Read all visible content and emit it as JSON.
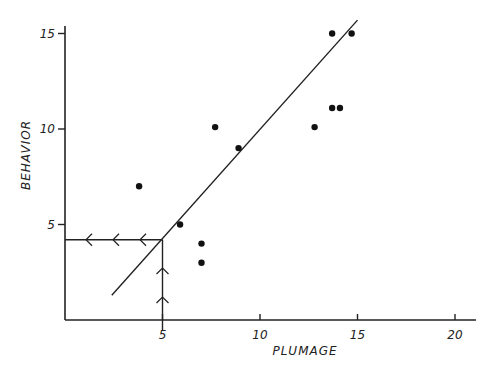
{
  "chart_data": {
    "type": "scatter",
    "title": "",
    "xlabel": "PLUMAGE",
    "ylabel": "BEHAVIOR",
    "xlim": [
      0,
      21
    ],
    "ylim": [
      0,
      16
    ],
    "grid": false,
    "xticks": [
      5,
      10,
      15,
      20
    ],
    "yticks": [
      5,
      10,
      15
    ],
    "xtick_labels": [
      "5",
      "10",
      "15",
      "20"
    ],
    "ytick_labels": [
      "5",
      "10",
      "15"
    ],
    "points": [
      {
        "x": 3.8,
        "y": 7.0
      },
      {
        "x": 5.9,
        "y": 5.0
      },
      {
        "x": 7.0,
        "y": 4.0
      },
      {
        "x": 7.0,
        "y": 3.0
      },
      {
        "x": 7.7,
        "y": 10.1
      },
      {
        "x": 8.9,
        "y": 9.0
      },
      {
        "x": 12.8,
        "y": 10.1
      },
      {
        "x": 13.7,
        "y": 11.1
      },
      {
        "x": 14.1,
        "y": 11.1
      },
      {
        "x": 13.7,
        "y": 15.0
      },
      {
        "x": 14.7,
        "y": 15.0
      }
    ],
    "fit_line": {
      "x1": 2.4,
      "y1": 1.3,
      "x2": 15.0,
      "y2": 15.7
    },
    "annotation": {
      "description": "Reading guide: vertical line up from plumage 5 to the fit line, then horizontal line left to behavior axis",
      "plumage_value": 5,
      "behavior_value": 4.2,
      "vertical_arrow_count": 2,
      "horizontal_arrow_count": 3
    }
  }
}
